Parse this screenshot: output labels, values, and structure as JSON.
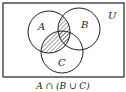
{
  "diagram": {
    "type": "venn",
    "universe_label": "U",
    "sets": [
      {
        "name": "A",
        "label": "A"
      },
      {
        "name": "B",
        "label": "B"
      },
      {
        "name": "C",
        "label": "C"
      }
    ],
    "shaded_region": "A ∩ (B ∪ C)",
    "caption": "A ∩ (B ∪ C)",
    "colors": {
      "stroke": "#222222",
      "hatch": "#222222",
      "background": "#ffffff"
    }
  }
}
